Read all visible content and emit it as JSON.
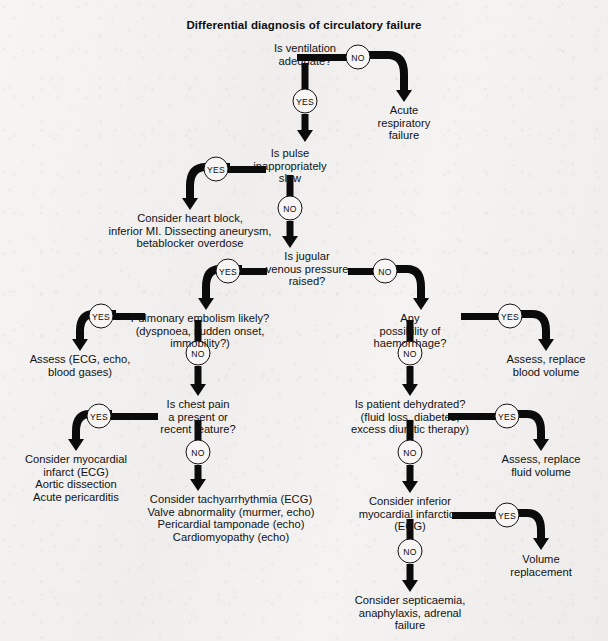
{
  "title": "Differential diagnosis of circulatory failure",
  "labels": {
    "yes": "YES",
    "no": "NO"
  },
  "nodes": {
    "ventilation": "Is ventilation\nadequate?",
    "acute_resp": "Acute\nrespiratory\nfailure",
    "pulse": "Is pulse\ninappropriately\nslow",
    "heart_block": "Consider heart block,\ninferior MI. Dissecting aneurysm,\nbetablocker overdose",
    "jvp": "Is jugular\nvenous pressure\nraised?",
    "pulmonary_embolism": "Pulmonary embolism likely?\n(dyspnoea, sudden onset,\nimmobility?)",
    "assess_pe": "Assess (ECG, echo,\nblood gases)",
    "chest_pain": "Is chest pain\na present or\nrecent feature?",
    "myocardial": "Consider myocardial\ninfarct (ECG)\nAortic dissection\nAcute pericarditis",
    "tachyarrhythmia": "Consider tachyarrhythmia (ECG)\nValve abnormality (murmer, echo)\nPericardial tamponade (echo)\nCardiomyopathy (echo)",
    "haemorrhage": "Any\npossibility of\nhaemorrhage?",
    "replace_blood": "Assess, replace\nblood volume",
    "dehydrated": "Is patient dehydrated?\n(fluid loss, diabetes,\nexcess diuretic therapy)",
    "replace_fluid": "Assess, replace\nfluid volume",
    "inferior_mi": "Consider inferior\nmyocardial infarction\n(ECG)",
    "volume_replacement": "Volume\nreplacement",
    "septicaemia": "Consider septicaemia,\nanaphylaxis, adrenal\nfailure"
  }
}
